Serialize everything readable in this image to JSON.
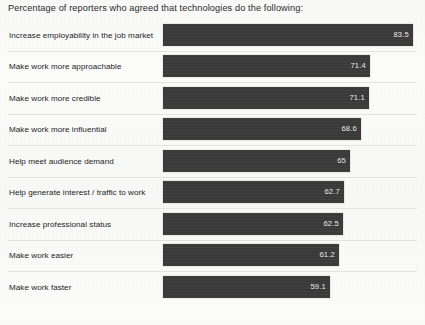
{
  "chart_data": {
    "type": "bar",
    "orientation": "horizontal",
    "title": "Percentage of reporters who agreed that technologies do the following:",
    "xlabel": "",
    "ylabel": "",
    "xlim": [
      0,
      100
    ],
    "grid": false,
    "legend": "none",
    "value_label_position": "inside-end",
    "bar_color": "#3a3a3a",
    "background_color": "#fcfcfb",
    "divider_color": "#e4e4e2",
    "categories": [
      "Increase employability in the job market",
      "Make work more approachable",
      "Make work more credible",
      "Make work more influential",
      "Help meet audience demand",
      "Help generate interest / traffic to work",
      "Increase professional status",
      "Make work easier",
      "Make work faster"
    ],
    "values": [
      83.5,
      71.4,
      71.1,
      68.6,
      65,
      62.7,
      62.5,
      61.2,
      59.1
    ],
    "value_labels": [
      "83.5",
      "71.4",
      "71.1",
      "68.6",
      "65",
      "62.7",
      "62.5",
      "61.2",
      "59.1"
    ],
    "bar_pixel_widths": [
      250,
      207,
      206,
      198,
      187,
      181,
      180,
      176,
      167
    ]
  }
}
